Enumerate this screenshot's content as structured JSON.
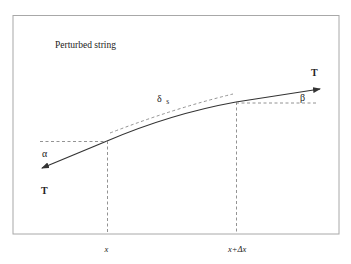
{
  "diagram": {
    "title": "Perturbed string",
    "labels": {
      "tension_right": "T",
      "tension_left": "T",
      "angle_left": "α",
      "angle_right": "β",
      "arc_length": "δ",
      "arc_length_sub": "s",
      "x_left": "x",
      "x_right": "x+Δx"
    },
    "colors": {
      "frame": "#a8a8a8",
      "string": "#333333",
      "dashed": "#777777",
      "text": "#222222"
    }
  }
}
